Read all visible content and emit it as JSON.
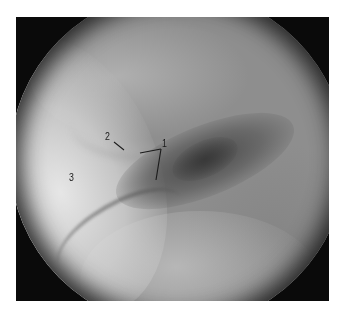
{
  "figure": {
    "type": "endoscopic-grayscale-photograph",
    "field_of_view": "circular",
    "colors": {
      "background": "#ffffff",
      "frame_corners": "#0a0a0a",
      "tissue_mid": "#8e8e8e",
      "tissue_bright": "#e0e0e0",
      "lumen_dark": "#3c3c3c",
      "annotation": "#1a1a1a"
    }
  },
  "annotations": [
    {
      "id": "1",
      "label": "1"
    },
    {
      "id": "2",
      "label": "2"
    },
    {
      "id": "3",
      "label": "3"
    }
  ]
}
